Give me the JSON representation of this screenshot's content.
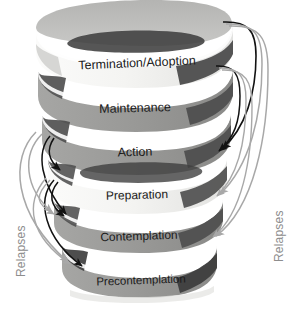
{
  "figure": {
    "type": "spiral-helix-diagram",
    "width": 290,
    "height": 313,
    "background_color": "#ffffff"
  },
  "stages": [
    {
      "id": "termination-adoption",
      "label": "Termination/Adoption",
      "order": 1,
      "band_color": "#f2f2f0",
      "text_color": "#1a1a1a",
      "position_from": "top"
    },
    {
      "id": "maintenance",
      "label": "Maintenance",
      "order": 2,
      "band_color": "#9a9a98",
      "text_color": "#1a1a1a",
      "position_from": "top"
    },
    {
      "id": "action",
      "label": "Action",
      "order": 3,
      "band_color": "#9a9a98",
      "text_color": "#1a1a1a",
      "position_from": "top"
    },
    {
      "id": "preparation",
      "label": "Preparation",
      "order": 4,
      "band_color": "#f2f2f0",
      "text_color": "#1a1a1a",
      "position_from": "top"
    },
    {
      "id": "contemplation",
      "label": "Contemplation",
      "order": 5,
      "band_color": "#9a9a98",
      "text_color": "#1a1a1a",
      "position_from": "top"
    },
    {
      "id": "precontemplation",
      "label": "Precontemplation",
      "order": 6,
      "band_color": "#9a9a98",
      "text_color": "#1a1a1a",
      "position_from": "top"
    }
  ],
  "annotations": {
    "relapses_left": "Relapses",
    "relapses_right": "Relapses",
    "label_color": "#8d8d8d"
  },
  "arrows": {
    "black_color": "#121212",
    "gray_color": "#a8a8a8",
    "right_group_count": 4,
    "left_group_count": 4,
    "description": "Curved relapse arrows looping from upper stages back down to lower stages on both sides"
  },
  "palette": {
    "band_light": "#f2f2f0",
    "band_gray": "#9a9a98",
    "band_dark_wedge": "#4a4a4a",
    "band_mid_wedge": "#6f6f6d",
    "shadow": "#d9d9d7",
    "outline": "#b8b8b6"
  }
}
